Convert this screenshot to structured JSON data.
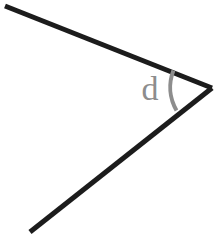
{
  "figure": {
    "background_color": "#ffffff",
    "width": 218,
    "height": 239
  },
  "geometry": {
    "vertex": {
      "x": 212,
      "y": 88,
      "name": "angle-vertex"
    },
    "rays": [
      {
        "name": "upper-ray",
        "from": {
          "x": 212,
          "y": 88
        },
        "to": {
          "x": 5,
          "y": 6
        },
        "color": "#1c1c1c",
        "thickness": 5
      },
      {
        "name": "lower-ray",
        "from": {
          "x": 212,
          "y": 88
        },
        "to": {
          "x": 30,
          "y": 232
        },
        "color": "#1c1c1c",
        "thickness": 5
      }
    ],
    "arc": {
      "name": "angle-arc",
      "color": "#8d8d8d",
      "thickness": 4,
      "radius": 46,
      "path": "M 173.4 70.6 A 46 46 0 0 0 176.5 110.4"
    }
  },
  "labels": {
    "angle_label": {
      "text": "d",
      "color": "#8d8d8d",
      "font_size": 34,
      "x": 150,
      "y": 100
    }
  }
}
